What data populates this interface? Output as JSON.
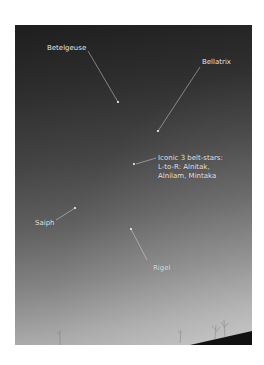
{
  "photo": {
    "subject": "Orion constellation night sky",
    "colors": {
      "sky_top": "#1e1e1e",
      "sky_bottom": "#bcbcbc",
      "roof": "#111111",
      "label": "#e8e8e8"
    }
  },
  "annotations": [
    {
      "label": "Betelgeuse",
      "label_x": 47,
      "label_y": 44,
      "line": [
        88,
        51,
        118,
        102
      ],
      "star": [
        118,
        102
      ]
    },
    {
      "label": "Bellatrix",
      "label_x": 202,
      "label_y": 58,
      "line": [
        200,
        67,
        158,
        131
      ],
      "star": [
        158,
        131
      ]
    },
    {
      "label": "Iconic 3 belt-stars: L-to-R: Alnitak, Alnilam, Mintaka",
      "lines": [
        "Iconic 3 belt-stars:",
        "L-to-R: Alnitak,",
        "Alnilam, Mintaka"
      ],
      "label_x": 158,
      "label_y": 154,
      "line": [
        156,
        158,
        135,
        164
      ],
      "star": [
        134,
        164
      ]
    },
    {
      "label": "Saiph",
      "label_x": 35,
      "label_y": 219,
      "line": [
        56,
        220,
        75,
        208
      ],
      "star": [
        75,
        208
      ]
    },
    {
      "label": "Rigel",
      "label_x": 153,
      "label_y": 264,
      "line": [
        147,
        260,
        131,
        229
      ],
      "star": [
        131,
        229
      ]
    }
  ]
}
